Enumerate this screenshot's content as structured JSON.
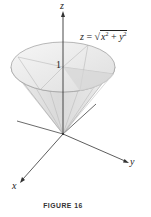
{
  "figure": {
    "caption": "FIGURE 16",
    "equation": {
      "lhs": "z",
      "equals": " = ",
      "sqrt_symbol": "√",
      "x": "x",
      "x_exp": "2",
      "plus": " + ",
      "y": "y",
      "y_exp": "2"
    },
    "axes": {
      "z_label": "z",
      "x_label": "x",
      "y_label": "y"
    },
    "tick_label": "1",
    "shape": "cone",
    "colors": {
      "axis": "#333333",
      "cone_fill": "#e6e6e6",
      "cone_edge": "#9a9a9a",
      "rim_fill": "#efefef",
      "shadow": "#cfcfcf"
    }
  }
}
